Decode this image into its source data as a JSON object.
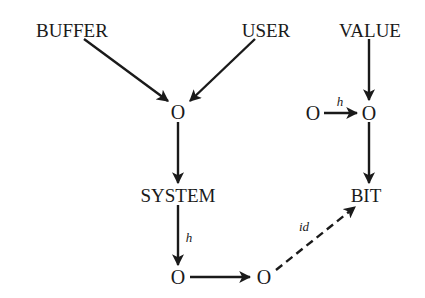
{
  "diagram": {
    "nodes": [
      {
        "id": "buffer",
        "label": "BUFFER"
      },
      {
        "id": "user",
        "label": "USER"
      },
      {
        "id": "value",
        "label": "VALUE"
      },
      {
        "id": "o1",
        "label": "O"
      },
      {
        "id": "o2",
        "label": "O"
      },
      {
        "id": "o3",
        "label": "O"
      },
      {
        "id": "system",
        "label": "SYSTEM"
      },
      {
        "id": "bit",
        "label": "BIT"
      },
      {
        "id": "o4",
        "label": "O"
      },
      {
        "id": "o5",
        "label": "O"
      }
    ],
    "edges": [
      {
        "from": "buffer",
        "to": "o1",
        "label": "",
        "style": "solid"
      },
      {
        "from": "user",
        "to": "o1",
        "label": "",
        "style": "solid"
      },
      {
        "from": "value",
        "to": "o3",
        "label": "",
        "style": "solid"
      },
      {
        "from": "o2",
        "to": "o3",
        "label": "h",
        "style": "solid"
      },
      {
        "from": "o1",
        "to": "system",
        "label": "",
        "style": "solid"
      },
      {
        "from": "o3",
        "to": "bit",
        "label": "",
        "style": "solid"
      },
      {
        "from": "system",
        "to": "o4",
        "label": "h",
        "style": "solid"
      },
      {
        "from": "o4",
        "to": "o5",
        "label": "",
        "style": "solid"
      },
      {
        "from": "o5",
        "to": "bit",
        "label": "id",
        "style": "dashed"
      }
    ]
  }
}
